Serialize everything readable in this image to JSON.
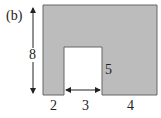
{
  "figure": {
    "label": "(b)",
    "shape": {
      "fill": "#bcbcbc",
      "stroke": "#555555",
      "description": "rectangle with rectangular notch removed from bottom"
    },
    "dimensions": {
      "height": "8",
      "notch_height": "5",
      "left_width": "2",
      "notch_width": "3",
      "right_width": "4"
    }
  }
}
